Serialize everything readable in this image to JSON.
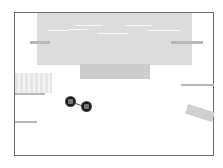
{
  "scene": {
    "type": "top-down game room",
    "colors": {
      "wall": "#6a6a6a",
      "floor": "#ffffff",
      "pool": "#dcdcdc",
      "step": "#cdcdcd",
      "platform": "#b8b8b8",
      "character": "#1a1a1a"
    },
    "objects": {
      "pool": "water-pool",
      "step": "pool-step",
      "crate": "striped-crate",
      "tilted_block": "tilted-block",
      "characters": [
        "player-one",
        "player-two"
      ]
    }
  }
}
